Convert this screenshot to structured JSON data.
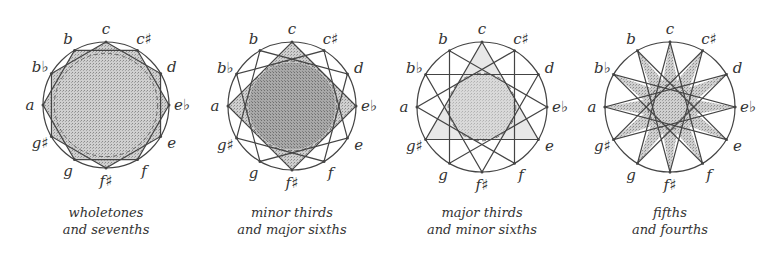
{
  "figure": {
    "note_order": [
      "c",
      "c#",
      "d",
      "eb",
      "e",
      "f",
      "f#",
      "g",
      "g#",
      "a",
      "bb",
      "b"
    ],
    "note_labels": [
      "c",
      "c♯",
      "d",
      "e♭",
      "e",
      "f",
      "f♯",
      "g",
      "g♯",
      "a",
      "b♭",
      "b"
    ],
    "colors": {
      "line": "#444444",
      "fill": "#bdbdbd",
      "fill_dark": "#9a9a9a",
      "background": "#ffffff"
    },
    "panels": [
      {
        "id": "wholetones",
        "caption_line1": "wholetones",
        "caption_line2": "and sevenths",
        "center": [
          106,
          105
        ],
        "radius": 63,
        "step": 2,
        "caption_x": 16
      },
      {
        "id": "minor-thirds",
        "caption_line1": "minor thirds",
        "caption_line2": "and major sixths",
        "center": [
          292,
          106
        ],
        "radius": 64,
        "step": 3,
        "caption_x": 202
      },
      {
        "id": "major-thirds",
        "caption_line1": "major thirds",
        "caption_line2": "and minor sixths",
        "center": [
          482,
          107
        ],
        "radius": 65,
        "step": 4,
        "caption_x": 392
      },
      {
        "id": "fifths",
        "caption_line1": "fifths",
        "caption_line2": "and fourths",
        "center": [
          670,
          107
        ],
        "radius": 65,
        "step": 5,
        "caption_x": 580
      }
    ]
  }
}
